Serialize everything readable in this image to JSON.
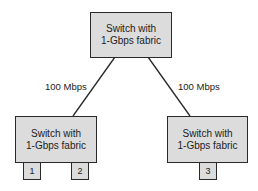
{
  "diagram": {
    "switches": [
      {
        "id": "top",
        "line1": "Switch with",
        "line2": "1-Gbps fabric"
      },
      {
        "id": "left",
        "line1": "Switch with",
        "line2": "1-Gbps fabric"
      },
      {
        "id": "right",
        "line1": "Switch with",
        "line2": "1-Gbps fabric"
      }
    ],
    "links": [
      {
        "from": "top",
        "to": "left",
        "label": "100 Mbps"
      },
      {
        "from": "top",
        "to": "right",
        "label": "100 Mbps"
      }
    ],
    "ports": [
      {
        "switch": "left",
        "label": "1"
      },
      {
        "switch": "left",
        "label": "2"
      },
      {
        "switch": "right",
        "label": "3"
      }
    ],
    "colors": {
      "box_fill": "#dcdcdc",
      "stroke": "#2a2a2a",
      "background": "#ffffff"
    }
  }
}
